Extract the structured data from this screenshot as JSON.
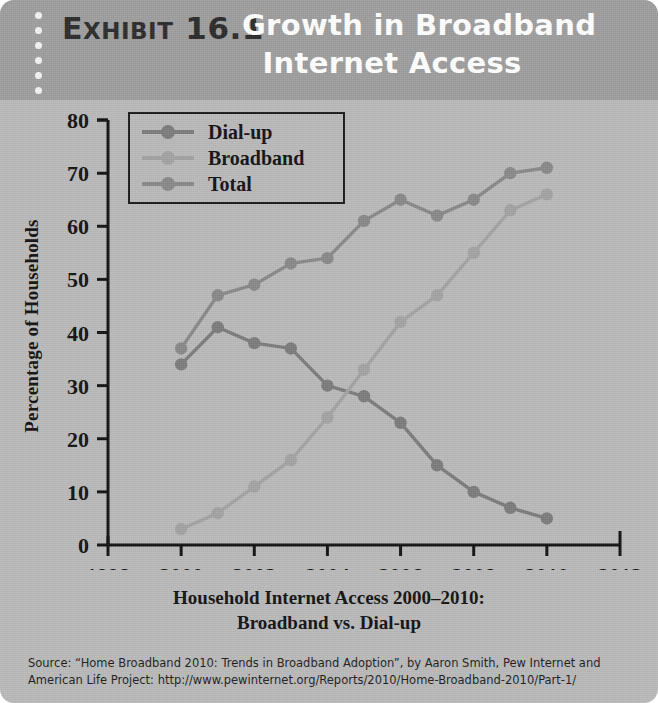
{
  "header": {
    "exhibit_word": "EXHIBIT",
    "exhibit_word_first": "E",
    "exhibit_word_rest": "XHIBIT",
    "exhibit_number": "16.1",
    "title_line1": "Growth in Broadband",
    "title_line2": "Internet Access"
  },
  "caption": {
    "line1": "Household Internet Access 2000–2010:",
    "line2": "Broadband vs. Dial-up"
  },
  "source": {
    "line1": "Source: “Home Broadband 2010: Trends in Broadband Adoption”, by Aaron Smith, Pew Internet and",
    "line2": "American Life Project: http://www.pewinternet.org/Reports/2010/Home-Broadband-2010/Part-1/"
  },
  "colors": {
    "card_background": "#b9b9b9",
    "header_background": "#9d9d9d",
    "header_title_text": "#ffffff",
    "exhibit_text": "#2a2a2a",
    "axis": "#111111",
    "dial_up": "#7b7b7b",
    "broadband": "#a2a2a2",
    "total": "#888888"
  },
  "chart_data": {
    "type": "line",
    "title": "Household Internet Access 2000–2010: Broadband vs. Dial-up",
    "xlabel": "",
    "ylabel": "Percentage of Households",
    "xlim": [
      1998,
      2012
    ],
    "ylim": [
      0,
      80
    ],
    "grid": false,
    "legend_position": "upper-left",
    "x": [
      2000,
      2001,
      2002,
      2003,
      2004,
      2005,
      2006,
      2007,
      2008,
      2009,
      2010
    ],
    "xticks": [
      1998,
      2000,
      2002,
      2004,
      2006,
      2008,
      2010,
      2012
    ],
    "xticklabels": [
      "1998",
      "2000",
      "2002",
      "2004",
      "2006",
      "2008",
      "2010",
      "2012"
    ],
    "yticks": [
      0,
      10,
      20,
      30,
      40,
      50,
      60,
      70,
      80
    ],
    "yticklabels": [
      "0",
      "10",
      "20",
      "30",
      "40",
      "50",
      "60",
      "70",
      "80"
    ],
    "series": [
      {
        "name": "Dial-up",
        "color": "#7b7b7b",
        "values": [
          34,
          41,
          38,
          37,
          30,
          28,
          23,
          15,
          10,
          7,
          5
        ]
      },
      {
        "name": "Broadband",
        "color": "#a2a2a2",
        "values": [
          3,
          6,
          11,
          16,
          24,
          33,
          42,
          47,
          55,
          63,
          66
        ]
      },
      {
        "name": "Total",
        "color": "#888888",
        "values": [
          37,
          47,
          49,
          53,
          54,
          61,
          65,
          62,
          65,
          70,
          71
        ]
      }
    ]
  }
}
